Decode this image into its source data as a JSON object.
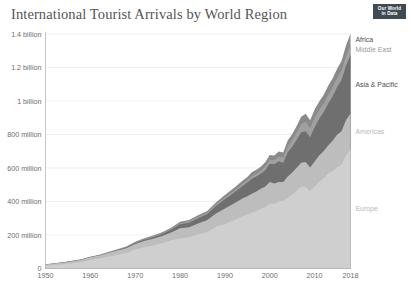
{
  "header": {
    "title": "International Tourist Arrivals by World Region",
    "logo_line1": "Our World",
    "logo_line2": "in Data"
  },
  "chart_data": {
    "type": "area",
    "title": "International Tourist Arrivals by World Region",
    "xlabel": "",
    "ylabel": "",
    "grid": true,
    "stacked": true,
    "legend_position": "right-inline",
    "xlim": [
      1950,
      2018
    ],
    "ylim": [
      0,
      1400000000
    ],
    "xticks": [
      1950,
      1960,
      1970,
      1980,
      1990,
      2000,
      2010,
      2018
    ],
    "xtick_labels": [
      "1950",
      "1960",
      "1970",
      "1980",
      "1990",
      "2000",
      "2010",
      "2018"
    ],
    "yticks": [
      0,
      200000000,
      400000000,
      600000000,
      800000000,
      1000000000,
      1200000000,
      1400000000
    ],
    "ytick_labels": [
      "0",
      "200 million",
      "400 million",
      "600 million",
      "800 million",
      "1 billion",
      "1.2 billion",
      "1.4 billion"
    ],
    "x": [
      1950,
      1952,
      1954,
      1956,
      1958,
      1960,
      1962,
      1964,
      1966,
      1968,
      1970,
      1972,
      1974,
      1976,
      1978,
      1980,
      1982,
      1984,
      1986,
      1988,
      1990,
      1992,
      1994,
      1995,
      1996,
      1997,
      1998,
      1999,
      2000,
      2001,
      2002,
      2003,
      2004,
      2005,
      2006,
      2007,
      2008,
      2009,
      2010,
      2011,
      2012,
      2013,
      2014,
      2015,
      2016,
      2017,
      2018
    ],
    "series": [
      {
        "name": "Europe",
        "color": "#cfcfcf",
        "label_color": "#b8b8b8",
        "values": [
          16800000,
          21000000,
          26000000,
          32000000,
          39000000,
          50400000,
          59000000,
          70000000,
          82000000,
          93000000,
          113000000,
          127000000,
          137000000,
          151000000,
          168000000,
          178500000,
          187000000,
          204000000,
          217000000,
          250000000,
          265000000,
          288000000,
          313000000,
          322000000,
          333000000,
          344000000,
          357000000,
          367000000,
          388000000,
          385000000,
          400000000,
          404000000,
          424000000,
          440000000,
          466000000,
          489000000,
          488000000,
          462000000,
          489000000,
          518000000,
          537000000,
          567000000,
          581000000,
          605000000,
          619000000,
          676000000,
          710000000
        ]
      },
      {
        "name": "Americas",
        "color": "#bdbdbd",
        "label_color": "#b8b8b8",
        "values": [
          7500000,
          9000000,
          10500000,
          12000000,
          13500000,
          16700000,
          19000000,
          22000000,
          25000000,
          28000000,
          33000000,
          37000000,
          40000000,
          43000000,
          47000000,
          62000000,
          60000000,
          65000000,
          71000000,
          78000000,
          92800000,
          100000000,
          106000000,
          109000000,
          114000000,
          116000000,
          119000000,
          122000000,
          128000000,
          122000000,
          117000000,
          113000000,
          126000000,
          133000000,
          136000000,
          143000000,
          148000000,
          141000000,
          150000000,
          156000000,
          163000000,
          168000000,
          182000000,
          193000000,
          200000000,
          211000000,
          216000000
        ]
      },
      {
        "name": "Asia & Pacific",
        "color": "#6f6f6f",
        "label_color": "#4d4d4d",
        "values": [
          200000,
          300000,
          500000,
          700000,
          1000000,
          1300000,
          1800000,
          2500000,
          3500000,
          4500000,
          6200000,
          8000000,
          10000000,
          12000000,
          16000000,
          23000000,
          26000000,
          31000000,
          36000000,
          45000000,
          56200000,
          64000000,
          75000000,
          82000000,
          89000000,
          89000000,
          89000000,
          98000000,
          110000000,
          115000000,
          124000000,
          114000000,
          144000000,
          154000000,
          166000000,
          182000000,
          184000000,
          181000000,
          205000000,
          218000000,
          233000000,
          249000000,
          264000000,
          284000000,
          306000000,
          324000000,
          348000000
        ]
      },
      {
        "name": "Middle East",
        "color": "#a0a0a0",
        "label_color": "#9a9a9a",
        "values": [
          100000,
          150000,
          250000,
          350000,
          500000,
          600000,
          800000,
          1100000,
          1500000,
          2000000,
          2600000,
          3200000,
          3800000,
          4500000,
          5500000,
          7100000,
          7500000,
          8000000,
          8500000,
          9500000,
          9600000,
          11000000,
          13000000,
          14000000,
          16000000,
          17000000,
          18000000,
          20000000,
          24000000,
          24000000,
          28000000,
          30000000,
          36000000,
          38000000,
          42000000,
          47000000,
          56000000,
          53000000,
          56000000,
          53000000,
          51000000,
          50000000,
          53000000,
          56000000,
          56000000,
          58000000,
          60000000
        ]
      },
      {
        "name": "Africa",
        "color": "#8a8a8a",
        "label_color": "#4d4d4d",
        "values": [
          500000,
          600000,
          800000,
          1000000,
          1200000,
          1500000,
          1900000,
          2400000,
          3000000,
          3600000,
          4400000,
          5200000,
          5800000,
          6400000,
          7200000,
          8000000,
          8500000,
          9200000,
          9800000,
          12000000,
          15200000,
          18000000,
          19000000,
          20000000,
          22000000,
          23000000,
          25000000,
          27000000,
          28000000,
          29000000,
          30000000,
          31000000,
          34000000,
          37000000,
          41000000,
          45000000,
          48000000,
          48000000,
          50000000,
          50000000,
          52000000,
          55000000,
          55000000,
          53000000,
          58000000,
          63000000,
          67000000
        ]
      }
    ]
  }
}
